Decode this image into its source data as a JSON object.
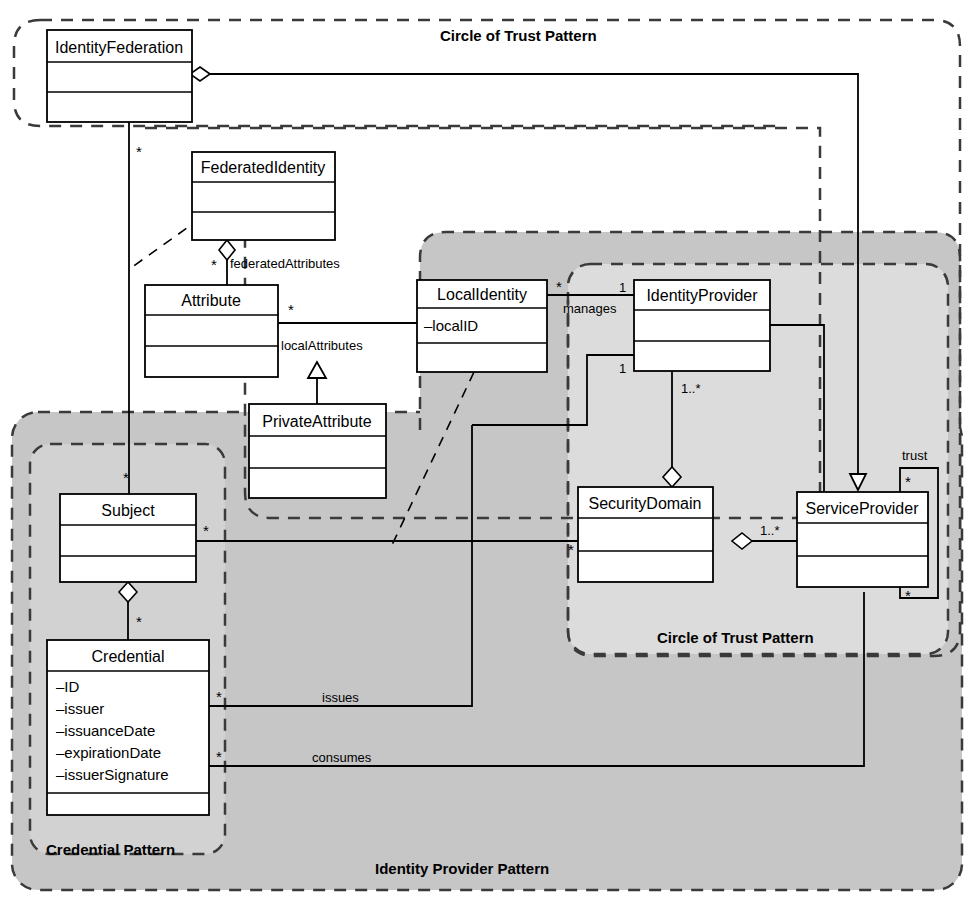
{
  "diagram": {
    "type": "uml-class-diagram"
  },
  "patterns": [
    {
      "id": "circle-of-trust-outer",
      "label": "Circle of Trust Pattern",
      "fill": "none",
      "border": "dashed"
    },
    {
      "id": "circle-of-trust-inner",
      "label": "Circle of Trust Pattern",
      "fill": "#dcdcdc",
      "border": "dashed"
    },
    {
      "id": "identity-provider",
      "label": "Identity Provider Pattern",
      "fill": "#c6c6c6",
      "border": "dashed"
    },
    {
      "id": "credential",
      "label": "Credential Pattern",
      "fill": "#d2d2d2",
      "border": "dashed"
    },
    {
      "id": "attribute-group",
      "label": "",
      "fill": "none",
      "border": "dashed"
    }
  ],
  "classes": [
    {
      "id": "identity-federation",
      "name": "IdentityFederation",
      "attributes": []
    },
    {
      "id": "federated-identity",
      "name": "FederatedIdentity",
      "attributes": []
    },
    {
      "id": "attribute",
      "name": "Attribute",
      "attributes": []
    },
    {
      "id": "private-attribute",
      "name": "PrivateAttribute",
      "attributes": []
    },
    {
      "id": "local-identity",
      "name": "LocalIdentity",
      "attributes": [
        "–localID"
      ]
    },
    {
      "id": "identity-provider",
      "name": "IdentityProvider",
      "attributes": []
    },
    {
      "id": "security-domain",
      "name": "SecurityDomain",
      "attributes": []
    },
    {
      "id": "service-provider",
      "name": "ServiceProvider",
      "attributes": []
    },
    {
      "id": "subject",
      "name": "Subject",
      "attributes": []
    },
    {
      "id": "credential",
      "name": "Credential",
      "attributes": [
        "–ID",
        "–issuer",
        "–issuanceDate",
        "–expirationDate",
        "–issuerSignature"
      ]
    }
  ],
  "roles": {
    "federated_attributes": "federatedAttributes",
    "local_attributes": "localAttributes",
    "manages": "manages",
    "issues": "issues",
    "consumes": "consumes",
    "trust": "trust"
  },
  "multiplicities": {
    "star": "*",
    "one": "1",
    "one_to_many": "1..*"
  },
  "labels": {
    "m_if_subject": "*",
    "m_fedattr": "*",
    "m_attr_local": "*",
    "m_localid_manages": "*",
    "m_idp_manages": "1",
    "m_idp_second": "1",
    "m_idp_secdom": "1..*",
    "m_secdom_sp": "1..*",
    "m_subject_star": "*",
    "m_subject_right": "*",
    "m_credential_star": "*",
    "m_cred_issues": "*",
    "m_cred_consumes": "*",
    "m_secdom_left": "*",
    "m_trust_top": "*",
    "m_trust_bottom": "*"
  },
  "colors": {
    "line": "#000000",
    "class_fill": "#ffffff",
    "idp_region": "#c6c6c6",
    "cot_region": "#dcdcdc",
    "credential_region": "#d2d2d2"
  }
}
